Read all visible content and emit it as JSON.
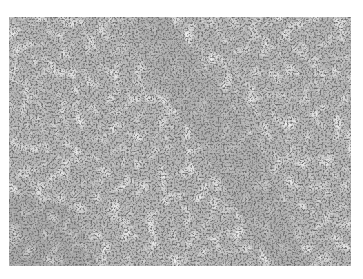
{
  "image": {
    "description": "Grayscale histology micrograph of densely packed small round cells with a diagonal lighter stromal band",
    "colors": {
      "background": "#ffffff",
      "tissue_base": "#b4b4b4",
      "nuclei": "#6e6e6e",
      "light_areas": "#dcdcdc",
      "band": "#a8a8a8"
    }
  }
}
